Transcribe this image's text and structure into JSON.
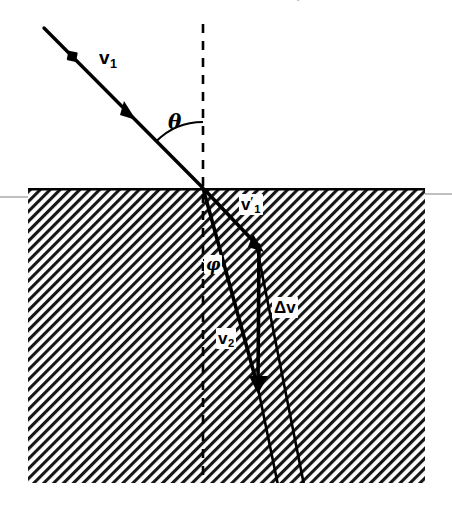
{
  "figure": {
    "kind": "refraction-vector-diagram",
    "width": 452,
    "height": 508,
    "background_color": "#ffffff",
    "ink_color": "#000000",
    "cropped_caption_text": "•",
    "interface": {
      "y": 188,
      "left_x": 28,
      "right_x": 425,
      "bottom_y": 483,
      "hatch_angle_deg": 45,
      "hatch_spacing_px": 7,
      "hatch_color": "#1a1a1a",
      "rule_color": "#b0b0b0"
    },
    "impact_point": {
      "x": 203,
      "y": 188
    }
  },
  "labels": {
    "incident_velocity": {
      "symbol": "v",
      "subscript": "1",
      "prime": "",
      "text": "v1"
    },
    "incidence_angle": {
      "symbol": "θ",
      "text": "θ"
    },
    "continued_velocity": {
      "symbol": "v",
      "subscript": "1",
      "prime": "′",
      "text": "v′1"
    },
    "refraction_angle": {
      "symbol": "φ",
      "text": "φ"
    },
    "velocity_change": {
      "symbol": "Δv",
      "delta": "Δ",
      "vector": "v",
      "text": "Δv"
    },
    "refracted_velocity": {
      "symbol": "v",
      "subscript": "2",
      "prime": "",
      "text": "v2"
    }
  },
  "geometry": {
    "incident_ray": {
      "from": {
        "x": 44,
        "y": 28
      },
      "to": {
        "x": 203,
        "y": 188
      }
    },
    "particle_marker": {
      "x": 72,
      "y": 56,
      "size": 9
    },
    "incident_arrowhead": {
      "x": 128,
      "y": 112
    },
    "normal_dashed_line": {
      "x": 203,
      "top_y": 24,
      "bottom_y": 483
    },
    "theta_arc": {
      "center": {
        "x": 203,
        "y": 188
      },
      "radius": 66,
      "from_deg": 225,
      "to_deg": 270
    },
    "v1_prime_vector": {
      "from": {
        "x": 203,
        "y": 188
      },
      "to": {
        "x": 259,
        "y": 247
      }
    },
    "v1_prime_extension": {
      "from": {
        "x": 259,
        "y": 247
      },
      "to": {
        "x": 305,
        "y": 486
      }
    },
    "delta_v_vector": {
      "from": {
        "x": 259,
        "y": 247
      },
      "to": {
        "x": 258,
        "y": 388
      }
    },
    "v2_vector": {
      "from": {
        "x": 203,
        "y": 188
      },
      "to": {
        "x": 258,
        "y": 388
      }
    },
    "v2_extension": {
      "from": {
        "x": 258,
        "y": 388
      },
      "to": {
        "x": 278,
        "y": 486
      }
    },
    "phi_arc": {
      "center": {
        "x": 203,
        "y": 188
      },
      "radius": 72,
      "from_deg": 270,
      "to_deg": 285
    }
  }
}
